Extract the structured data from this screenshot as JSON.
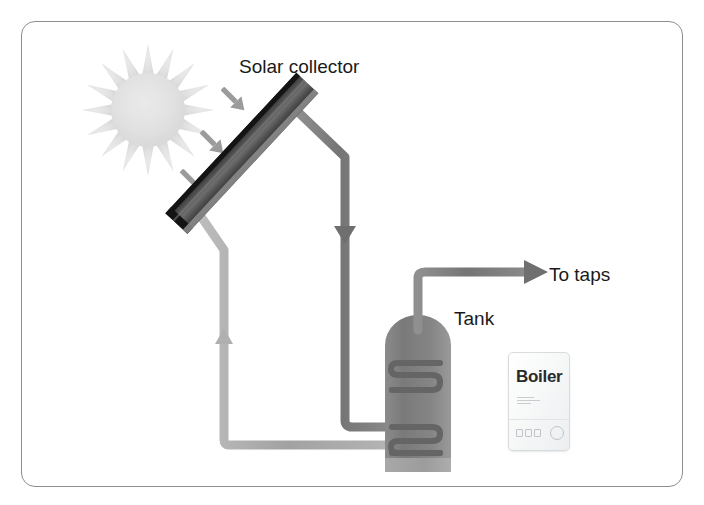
{
  "diagram": {
    "title_visible": false,
    "labels": {
      "solar_collector": "Solar collector",
      "to_taps": "To taps",
      "tank": "Tank",
      "boiler": "Boiler"
    },
    "components": [
      {
        "name": "sun",
        "icon": "sun-icon",
        "color": "#e2e2e2"
      },
      {
        "name": "solar-collector",
        "icon": "solar-panel-icon",
        "color": "#3a3a3a"
      },
      {
        "name": "hot-water-tank",
        "icon": "tank-icon",
        "color": "#7c7c7c"
      },
      {
        "name": "boiler",
        "icon": "boiler-icon",
        "color": "#f2f3f4"
      }
    ],
    "flows": [
      {
        "name": "sun-rays",
        "direction": "down-right",
        "count": 3,
        "color": "#9a9a9a"
      },
      {
        "name": "collector-to-tank-flow",
        "direction": "down",
        "arrow": "down-arrow",
        "color": "#7f7f7f"
      },
      {
        "name": "tank-to-collector-return",
        "direction": "up",
        "arrow": "up-arrow",
        "color": "#a9a9a9"
      },
      {
        "name": "tank-to-taps",
        "direction": "right",
        "arrow": "right-arrow",
        "color": "#7f7f7f"
      }
    ],
    "colors": {
      "frame_border": "#8d8d8d",
      "pipe_hot": "#7f7f7f",
      "pipe_cool": "#a9a9a9",
      "tank_body": "#7c7c7c",
      "coil": "#6b6b6b",
      "panel_dark": "#2e2e2e",
      "background": "#ffffff"
    }
  }
}
